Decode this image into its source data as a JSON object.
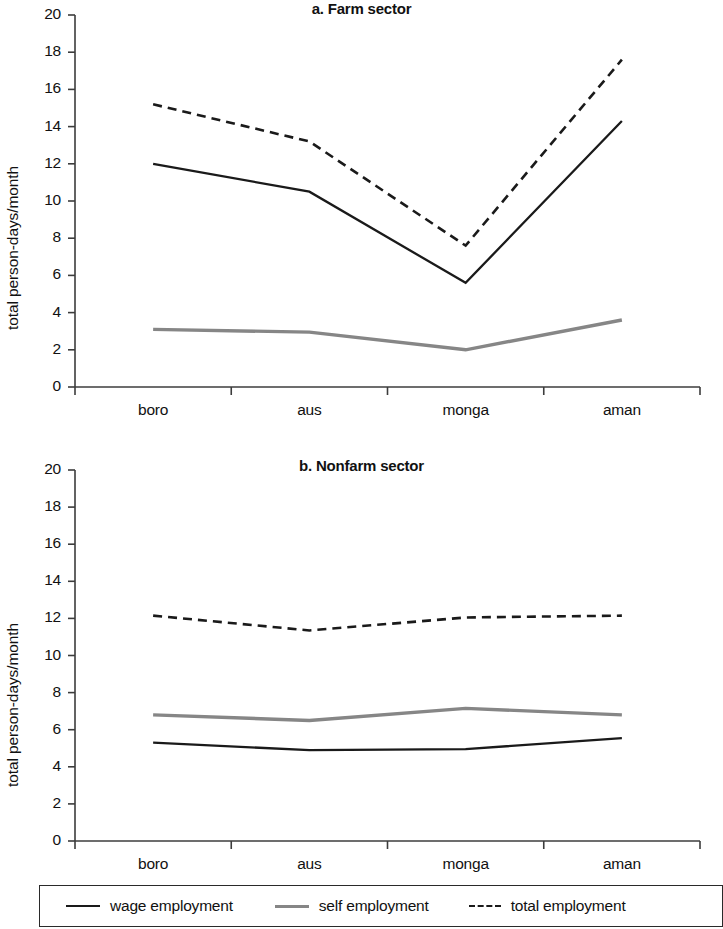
{
  "figure": {
    "panels": [
      {
        "id": "farm",
        "title": "a. Farm sector",
        "ylabel": "total person-days/month"
      },
      {
        "id": "nonfarm",
        "title": "b. Nonfarm sector",
        "ylabel": "total person-days/month"
      }
    ]
  },
  "axis": {
    "y_ticks": [
      "0",
      "2",
      "4",
      "6",
      "8",
      "10",
      "12",
      "14",
      "16",
      "18",
      "20"
    ],
    "x_categories": [
      "boro",
      "aus",
      "monga",
      "aman"
    ]
  },
  "legend": {
    "items": [
      {
        "label": "wage employment",
        "style": "solid",
        "color": "#1a1a1a"
      },
      {
        "label": "self employment",
        "style": "solid",
        "color": "#868686"
      },
      {
        "label": "total employment",
        "style": "dashed",
        "color": "#1a1a1a"
      }
    ]
  },
  "chart_data": [
    {
      "type": "line",
      "title": "a. Farm sector",
      "xlabel": "",
      "ylabel": "total person-days/month",
      "categories": [
        "boro",
        "aus",
        "monga",
        "aman"
      ],
      "ylim": [
        0,
        20
      ],
      "ytick_step": 2,
      "grid": false,
      "legend_position": "bottom-shared",
      "series": [
        {
          "name": "wage employment",
          "style": "solid",
          "color": "#1a1a1a",
          "values": [
            12.0,
            10.5,
            5.6,
            14.3
          ]
        },
        {
          "name": "self employment",
          "style": "solid",
          "color": "#868686",
          "values": [
            3.1,
            2.95,
            2.0,
            3.6
          ]
        },
        {
          "name": "total employment",
          "style": "dashed",
          "color": "#1a1a1a",
          "values": [
            15.2,
            13.2,
            7.6,
            17.6
          ]
        }
      ]
    },
    {
      "type": "line",
      "title": "b. Nonfarm sector",
      "xlabel": "",
      "ylabel": "total person-days/month",
      "categories": [
        "boro",
        "aus",
        "monga",
        "aman"
      ],
      "ylim": [
        0,
        20
      ],
      "ytick_step": 2,
      "grid": false,
      "legend_position": "bottom-shared",
      "series": [
        {
          "name": "wage employment",
          "style": "solid",
          "color": "#1a1a1a",
          "values": [
            5.3,
            4.9,
            4.95,
            5.55
          ]
        },
        {
          "name": "self employment",
          "style": "solid",
          "color": "#868686",
          "values": [
            6.8,
            6.5,
            7.15,
            6.8
          ]
        },
        {
          "name": "total employment",
          "style": "dashed",
          "color": "#1a1a1a",
          "values": [
            12.15,
            11.35,
            12.05,
            12.15
          ]
        }
      ]
    }
  ]
}
